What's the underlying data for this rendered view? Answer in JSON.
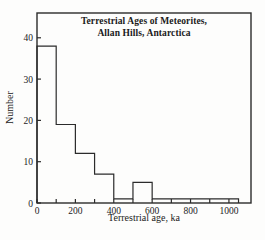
{
  "figure": {
    "title_line1": "Terrestrial Ages of Meteorites,",
    "title_line2": "Allan Hills, Antarctica",
    "xlabel": "Terrestrial age, ka",
    "ylabel": "Number"
  },
  "chart_data": {
    "type": "bar",
    "subtype": "step-histogram",
    "title": "Terrestrial Ages of Meteorites, Allan Hills, Antarctica",
    "xlabel": "Terrestrial age, ka",
    "ylabel": "Number",
    "bin_edges": [
      0,
      100,
      200,
      300,
      400,
      500,
      600,
      700,
      800,
      900,
      1000,
      1050
    ],
    "values": [
      38,
      19,
      12,
      7,
      1,
      5,
      1,
      1,
      1,
      1,
      1
    ],
    "xlim": [
      0,
      1115
    ],
    "ylim": [
      0,
      46
    ],
    "xticks": [
      0,
      100,
      200,
      300,
      400,
      500,
      600,
      700,
      800,
      900,
      1000
    ],
    "labeled_xticks": [
      0,
      200,
      400,
      600,
      800,
      1000
    ],
    "yticks": [
      0,
      10,
      20,
      30,
      40
    ],
    "grid": false,
    "legend": "none",
    "line_color": "#2b2b2b",
    "text_color": "#1c1c1c",
    "background": "#fdfdfc"
  }
}
